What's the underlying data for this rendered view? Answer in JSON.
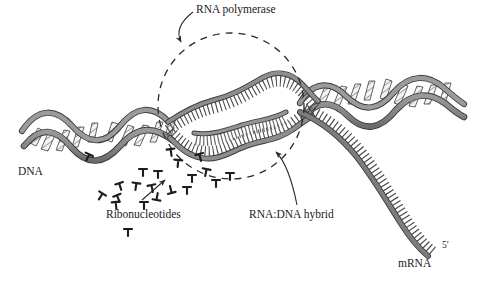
{
  "figure": {
    "type": "biology-diagram",
    "width": 478,
    "height": 285,
    "background": "#ffffff"
  },
  "labels": {
    "rna_polymerase": "RNA polymerase",
    "dna": "DNA",
    "ribonucleotides": "Ribonucleotides",
    "rna_dna_hybrid": "RNA:DNA hybrid",
    "mrna": "mRNA",
    "five_prime": "5′"
  },
  "colors": {
    "ribbon_fill": "#8a8a8a",
    "ribbon_fill_dark": "#6f6f6f",
    "ribbon_stroke": "#3a3a3a",
    "rung_fill": "#f2f2f2",
    "teeth": "#4a4a4a",
    "dashed_circle": "#2b2b2b",
    "text": "#1a1a1a",
    "nucleotide": "#1c1c1c",
    "leader": "#2b2b2b"
  },
  "elements": {
    "polymerase_bubble": {
      "name": "dashed circle marking RNA polymerase footprint",
      "cx": 231,
      "cy": 106,
      "r": 73,
      "dash": "7 6"
    },
    "dna_left": {
      "name": "intact DNA double helix entering from left",
      "description": "two gray ribbon strands with hatched base-pair rungs"
    },
    "dna_right": {
      "name": "re-formed DNA double helix exiting to right",
      "description": "two gray ribbon strands with hatched base-pair rungs"
    },
    "bubble_strands": {
      "name": "separated DNA strands inside transcription bubble",
      "count": 2,
      "description": "non-template strand on top, template strand on bottom, both with comb-tooth unpaired bases"
    },
    "hybrid_region": {
      "name": "RNA:DNA hybrid",
      "description": "nascent RNA base-paired to the template DNA strand with interlocking teeth"
    },
    "mrna_strand": {
      "name": "nascent mRNA transcript",
      "description": "single ribbon curving down to lower right, comb teeth on outer edge, ends at 5 prime"
    }
  },
  "ribonucleotides": {
    "count": 21,
    "glyph": "T-shaped free nucleotide",
    "positions": [
      {
        "x": 88,
        "y": 157,
        "rot": 25
      },
      {
        "x": 171,
        "y": 152,
        "rot": -8
      },
      {
        "x": 178,
        "y": 163,
        "rot": 5
      },
      {
        "x": 143,
        "y": 172,
        "rot": 0
      },
      {
        "x": 158,
        "y": 174,
        "rot": 0
      },
      {
        "x": 192,
        "y": 178,
        "rot": 0
      },
      {
        "x": 206,
        "y": 172,
        "rot": 12
      },
      {
        "x": 216,
        "y": 183,
        "rot": 0
      },
      {
        "x": 120,
        "y": 186,
        "rot": -18
      },
      {
        "x": 136,
        "y": 186,
        "rot": 8
      },
      {
        "x": 152,
        "y": 188,
        "rot": -12
      },
      {
        "x": 101,
        "y": 196,
        "rot": 32
      },
      {
        "x": 118,
        "y": 198,
        "rot": -22
      },
      {
        "x": 171,
        "y": 190,
        "rot": 165
      },
      {
        "x": 187,
        "y": 190,
        "rot": 0
      },
      {
        "x": 144,
        "y": 205,
        "rot": 0
      },
      {
        "x": 157,
        "y": 197,
        "rot": 190
      },
      {
        "x": 128,
        "y": 232,
        "rot": 0
      },
      {
        "x": 200,
        "y": 157,
        "rot": -15
      },
      {
        "x": 230,
        "y": 176,
        "rot": 0
      },
      {
        "x": 116,
        "y": 205,
        "rot": -5
      }
    ],
    "arrow": {
      "name": "arrow from ribonucleotide pool into polymerase",
      "x1": 142,
      "y1": 200,
      "x2": 165,
      "y2": 180
    }
  },
  "leaders": {
    "polymerase": {
      "name": "curved leader from RNA polymerase label to bubble",
      "description": "curves down-left ending in arrowhead at circle edge"
    },
    "hybrid": {
      "name": "curved leader from RNA:DNA hybrid label up to hybrid region",
      "description": "curves up-left ending in arrowhead"
    }
  },
  "label_positions": {
    "rna_polymerase": {
      "left": 196,
      "top": 4
    },
    "dna": {
      "left": 18,
      "top": 166
    },
    "ribonucleotides": {
      "left": 106,
      "top": 209
    },
    "rna_dna_hybrid": {
      "left": 249,
      "top": 209
    },
    "mrna": {
      "left": 398,
      "top": 258
    },
    "five_prime": {
      "left": 442,
      "top": 241
    }
  }
}
